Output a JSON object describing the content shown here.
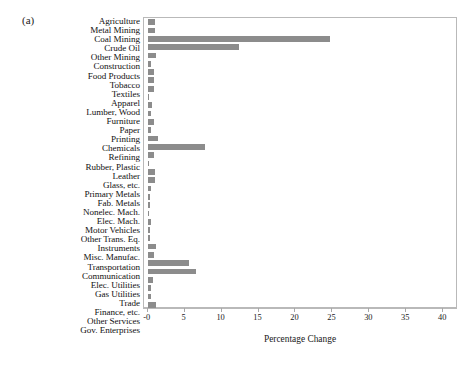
{
  "panel": {
    "label": "(a)"
  },
  "chart_data": {
    "type": "bar",
    "orientation": "horizontal",
    "title": "",
    "subtitle": "",
    "xlabel": "Percentage Change",
    "ylabel": "",
    "xlim": [
      -0.5,
      42
    ],
    "xticks": [
      0,
      5,
      10,
      15,
      20,
      25,
      30,
      35,
      40
    ],
    "xticklabels": [
      "-0",
      "5",
      "10",
      "15",
      "20",
      "25",
      "30",
      "35",
      "40"
    ],
    "grid": false,
    "legend": null,
    "bar_color": "#8c8c8c",
    "frame_color": "#b9b9b9",
    "categories": [
      "Agriculture",
      "Metal Mining",
      "Coal Mining",
      "Crude Oil",
      "Other Mining",
      "Construction",
      "Food Products",
      "Tobacco",
      "Textiles",
      "Apparel",
      "Lumber, Wood",
      "Furniture",
      "Paper",
      "Printing",
      "Chemicals",
      "Refining",
      "Rubber, Plastic",
      "Leather",
      "Glass, etc.",
      "Primary Metals",
      "Fab. Metals",
      "Nonelec. Mach.",
      "Elec. Mach.",
      "Motor Vehicles",
      "Other Trans. Eq.",
      "Instruments",
      "Misc. Manufac.",
      "Transportation",
      "Communication",
      "Elec. Utilities",
      "Gas Utilities",
      "Trade",
      "Finance, etc.",
      "Other Services",
      "Gov. Enterprises"
    ],
    "values": [
      1.0,
      1.0,
      24.7,
      12.3,
      1.1,
      0.5,
      0.9,
      0.9,
      0.9,
      0.15,
      0.6,
      0.4,
      0.9,
      0.5,
      1.4,
      7.7,
      0.9,
      0.12,
      1.0,
      1.0,
      0.5,
      0.35,
      0.35,
      0.15,
      0.4,
      0.35,
      0.3,
      1.1,
      0.8,
      5.6,
      6.6,
      0.7,
      0.5,
      0.5,
      1.1
    ]
  }
}
